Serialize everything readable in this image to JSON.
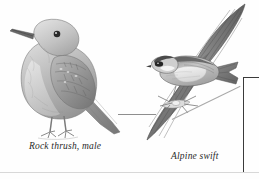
{
  "plate": {
    "background_color": "#fefefe",
    "width": 259,
    "height": 179,
    "medium": "grayscale pen-and-ink / pencil field-guide illustration"
  },
  "figures": [
    {
      "id": "rock-thrush",
      "caption": "Rock thrush, male",
      "pose": "perched, facing left, profile",
      "ink_color": "#8a8a8a",
      "accent_color": "#3c3c3c"
    },
    {
      "id": "alpine-swift",
      "caption": "Alpine swift",
      "pose": "in flight, wings swept, facing left",
      "ink_color": "#7c7c7c",
      "accent_color": "#2f2f2f"
    }
  ],
  "captions": {
    "rock_thrush": "Rock thrush, male",
    "alpine_swift": "Alpine swift"
  },
  "rules": {
    "leader_color": "#a9a9a9",
    "frame_color": "#3a3a3a",
    "bottom_rule_color": "#d8d8d8"
  }
}
